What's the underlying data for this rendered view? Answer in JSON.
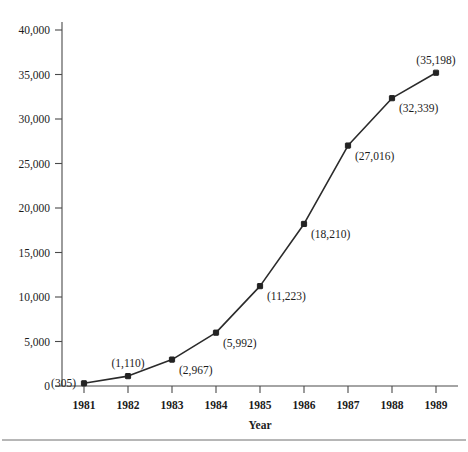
{
  "chart_data": {
    "type": "line",
    "title": "",
    "subtitle": "",
    "xlabel": "Year",
    "ylabel": "",
    "categories": [
      "1981",
      "1982",
      "1983",
      "1984",
      "1985",
      "1986",
      "1987",
      "1988",
      "1989"
    ],
    "x": [
      1981,
      1982,
      1983,
      1984,
      1985,
      1986,
      1987,
      1988,
      1989
    ],
    "values": [
      305,
      1110,
      2967,
      5992,
      11223,
      18210,
      27016,
      32339,
      35198
    ],
    "point_labels": [
      "(305)",
      "(1,110)",
      "(2,967)",
      "(5,992)",
      "(11,223)",
      "(18,210)",
      "(27,016)",
      "(32,339)",
      "(35,198)"
    ],
    "label_placement": [
      "left",
      "above",
      "below-right",
      "below-right",
      "below-right",
      "below-right",
      "below-right",
      "below-right",
      "above"
    ],
    "ylim": [
      0,
      40000
    ],
    "ytick_values": [
      0,
      5000,
      10000,
      15000,
      20000,
      25000,
      30000,
      35000,
      40000
    ],
    "ytick_labels": [
      "0",
      "5,000",
      "10,000",
      "15,000",
      "20,000",
      "25,000",
      "30,000",
      "35,000",
      "40,000"
    ],
    "xlim": [
      1980.5,
      1989.5
    ],
    "grid": false,
    "legend": null,
    "marker": "filled-square",
    "line_color": "#2b2b2b",
    "marker_color": "#232323",
    "axis_color": "#4a4a4a",
    "background_color": "#ffffff"
  },
  "footnote": {
    "rule": true,
    "text": ""
  }
}
